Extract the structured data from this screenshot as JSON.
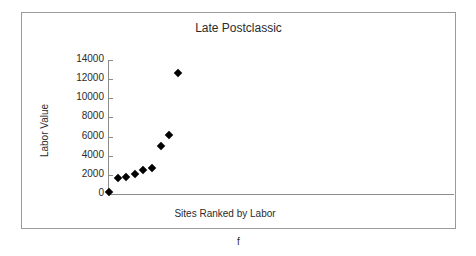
{
  "figure": {
    "caption": "f"
  },
  "chart_data": {
    "type": "scatter",
    "title": "Late Postclassic",
    "xlabel": "Sites Ranked by Labor",
    "ylabel": "Labor Value",
    "grid": false,
    "legend": null,
    "legend_position": "none",
    "marker": "filled-diamond",
    "marker_color": "#000000",
    "ylim": [
      0,
      14000
    ],
    "yticks": [
      0,
      2000,
      4000,
      6000,
      8000,
      10000,
      12000,
      14000
    ],
    "ytick_labels": [
      "0",
      "2000",
      "4000",
      "6000",
      "8000",
      "10000",
      "12000",
      "14000"
    ],
    "xlim": [
      0,
      40
    ],
    "xticks": [],
    "xtick_labels": [],
    "x": [
      1,
      2,
      3,
      4,
      5,
      6,
      7,
      8,
      9
    ],
    "values": [
      200,
      1700,
      1800,
      2100,
      2550,
      2750,
      5000,
      6150,
      12650
    ],
    "points": [
      {
        "rank": 1,
        "labor_value": 200
      },
      {
        "rank": 2,
        "labor_value": 1700
      },
      {
        "rank": 3,
        "labor_value": 1800
      },
      {
        "rank": 4,
        "labor_value": 2100
      },
      {
        "rank": 5,
        "labor_value": 2550
      },
      {
        "rank": 6,
        "labor_value": 2750
      },
      {
        "rank": 7,
        "labor_value": 5000
      },
      {
        "rank": 8,
        "labor_value": 6150
      },
      {
        "rank": 9,
        "labor_value": 12650
      }
    ]
  },
  "colors": {
    "frame": "#9a9a9a",
    "axis": "#8c8c8c",
    "text": "#2b2b2b",
    "marker": "#000000",
    "background": "#ffffff"
  }
}
